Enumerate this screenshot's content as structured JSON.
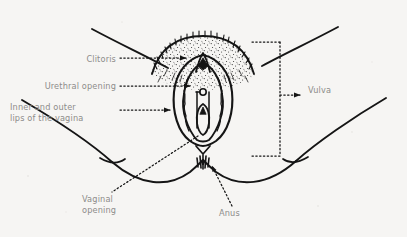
{
  "figure": {
    "style": "line drawing with stippling on off-white paper",
    "background_color": "#f6f5f3",
    "ink_color": "#1a1a1a",
    "label_color": "#8d8c8a",
    "width": 407,
    "height": 237
  },
  "labels": {
    "clitoris": {
      "text": "Clitoris",
      "align": "right",
      "leader": "dotted-horizontal-with-arrowhead"
    },
    "urethral_opening": {
      "text": "Urethral opening",
      "align": "right",
      "leader": "dotted-horizontal-with-arrowhead"
    },
    "inner_outer_lips": {
      "line1": "Inner and outer",
      "line2": "lips of the vagina",
      "align": "left",
      "leader": "dotted-horizontal-with-arrowhead"
    },
    "vulva": {
      "text": "Vulva",
      "align": "left",
      "leader": "dotted-bracket-with-arrowhead"
    },
    "vaginal_opening": {
      "line1": "Vaginal",
      "line2": "opening",
      "align": "left",
      "leader": "dotted-diagonal"
    },
    "anus": {
      "text": "Anus",
      "align": "left",
      "leader": "dotted-diagonal-with-arrowhead"
    }
  },
  "structures": [
    {
      "name": "mons-pubis",
      "description": "stippled pubic hair region at top center"
    },
    {
      "name": "outer-labia",
      "description": "outer lips, large oval outline"
    },
    {
      "name": "inner-labia",
      "description": "inner lips, wavy inner oval"
    },
    {
      "name": "clitoral-hood",
      "description": "narrow peak at top of vulva"
    },
    {
      "name": "urethral-opening",
      "description": "small circle above vaginal opening"
    },
    {
      "name": "vaginal-opening",
      "description": "oval opening in lower vestibule"
    },
    {
      "name": "perineum",
      "description": "area between vulva and anus"
    },
    {
      "name": "anus",
      "description": "small radial star shape below perineum"
    },
    {
      "name": "thigh-left",
      "description": "left thigh contour sweeping down-left"
    },
    {
      "name": "thigh-right",
      "description": "right thigh contour sweeping down-right"
    },
    {
      "name": "buttock-crease-left",
      "description": "short fold line on left"
    },
    {
      "name": "buttock-crease-right",
      "description": "short fold line on right"
    },
    {
      "name": "groin-crease-left",
      "description": "diagonal line upper-left to mons"
    },
    {
      "name": "groin-crease-right",
      "description": "diagonal line upper-right to mons"
    }
  ]
}
